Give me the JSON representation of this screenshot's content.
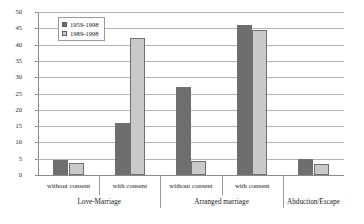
{
  "chart_data": {
    "type": "bar",
    "title": "",
    "xlabel": "",
    "ylabel": "",
    "ylim": [
      0,
      50
    ],
    "ytick_step": 5,
    "yticks": [
      50,
      45,
      40,
      35,
      30,
      25,
      20,
      15,
      10,
      5,
      0
    ],
    "grid": true,
    "legend_position": "upper-left-inside",
    "categories": [
      "without consent",
      "with consent",
      "without consent",
      "with consent",
      ""
    ],
    "groups": [
      {
        "label": "Love-Marriage",
        "categories": [
          "without consent",
          "with consent"
        ]
      },
      {
        "label": "Arranged marriage",
        "categories": [
          "without consent",
          "with consent"
        ]
      },
      {
        "label": "Abduction/Escape",
        "categories": [
          ""
        ]
      }
    ],
    "series": [
      {
        "name": "1959-1998",
        "color": "#6e6e6e",
        "values": [
          4.7,
          16.0,
          27.0,
          46.0,
          5.0
        ]
      },
      {
        "name": "1989-1998",
        "color": "#c9c9c9",
        "values": [
          3.8,
          42.0,
          4.3,
          44.5,
          3.5
        ]
      }
    ]
  }
}
